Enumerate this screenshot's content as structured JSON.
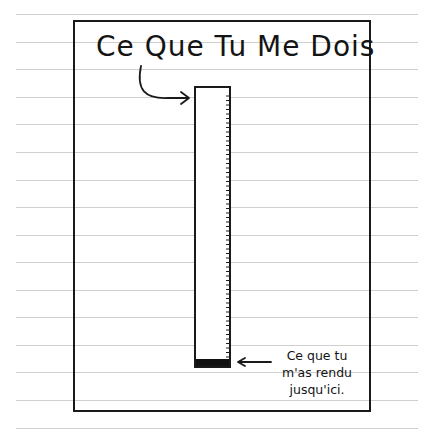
{
  "chart_data": {
    "type": "bar",
    "title": "Ce Que Tu Me Dois",
    "categories": [
      "Ce Que Tu Me Dois"
    ],
    "series": [
      {
        "name": "Total dû",
        "values": [
          100
        ]
      },
      {
        "name": "Ce que tu m'as rendu jusqu'ici.",
        "values": [
          2.5
        ]
      }
    ],
    "annotations": [
      {
        "text": "Ce Que Tu Me Dois",
        "points_to": "top of bar"
      },
      {
        "text": "Ce que tu m'as rendu jusqu'ici.",
        "points_to": "filled bottom of bar"
      }
    ],
    "xlabel": "",
    "ylabel": "",
    "ylim": [
      0,
      100
    ],
    "grid": false,
    "legend": "none",
    "style": "hand-drawn comic on ruled notebook paper"
  },
  "title": "Ce Que Tu Me Dois",
  "note_lines": [
    "Ce que tu",
    "m'as rendu",
    "jusqu'ici."
  ],
  "fill_percent": 2.5,
  "colors": {
    "ink": "#141414",
    "paper": "#ffffff",
    "ruled_line": "#cfcfcf"
  }
}
